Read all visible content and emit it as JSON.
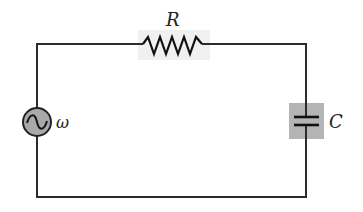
{
  "diagram": {
    "type": "RC circuit",
    "components": {
      "resistor": {
        "label": "R"
      },
      "source": {
        "label": "ω",
        "symbol": "ac-source"
      },
      "capacitor": {
        "label": "C"
      }
    },
    "colors": {
      "wire": "#2b2b2b",
      "component_bg": "#f0f0f0",
      "source_fill": "#a9a9a9",
      "capacitor_bg": "#b4b4b4"
    }
  }
}
